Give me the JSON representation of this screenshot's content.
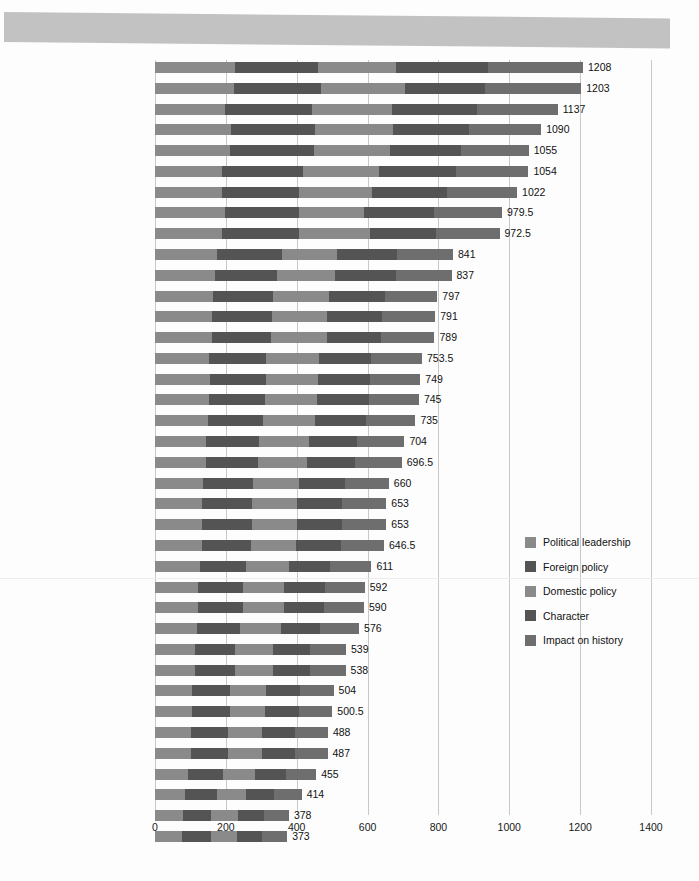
{
  "chart_data": {
    "type": "bar",
    "subtype": "stacked-horizontal",
    "title": "",
    "xlabel": "",
    "ylabel": "",
    "xlim": [
      0,
      1400
    ],
    "xticks": [
      0,
      200,
      400,
      600,
      800,
      1000,
      1200,
      1400
    ],
    "grid": true,
    "legend_position": "right",
    "series": [
      {
        "name": "Political leadership",
        "color": "#8a8a8a"
      },
      {
        "name": "Foreign policy",
        "color": "#545454"
      },
      {
        "name": "Domestic policy",
        "color": "#8a8a8a"
      },
      {
        "name": "Character",
        "color": "#545454"
      },
      {
        "name": "Impact on history",
        "color": "#6e6e6e"
      }
    ],
    "categories": [
      "Abraham Lincoln",
      "Franklin D. Roosevelt",
      "George Washington",
      "Theodore Roosevelt",
      "Thomas Jefferson",
      "Harry Truman",
      "Woodrow Wilson",
      "Andrew Jackson",
      "Dwight D. Eisenhower",
      "Ronald Reagan",
      "James K. Polk",
      "James Madison",
      "James Monroe",
      "William McKinley",
      "Lyndon B. Johnson",
      "John Adams",
      "Grover Cleveland",
      "John F. Kennedy",
      "Richard M. Nixon",
      "John Quincy Adams",
      "George Bush",
      "William Howard Taft",
      "Jimmy Carter",
      "Herbert C. Hoover",
      "Martin Van Buren",
      "Calvin Coolidge",
      "Rutherford B. Hayes",
      "Gerald R. Ford",
      "Ulysses S. Grant",
      "John Tyler",
      "Benjamin Harrison",
      "Zachary Taylor",
      "Millard Fillmore",
      "Chester A. Arthur",
      "Andrew Johnson",
      "Franklin Pierce",
      "James Buchanan",
      "Warren G. Harding"
    ],
    "values": [
      1208,
      1203,
      1137,
      1090,
      1055,
      1054,
      1022,
      979.5,
      972.5,
      841,
      837,
      797,
      791,
      789,
      753.5,
      749,
      745,
      735,
      704,
      696.5,
      660,
      653,
      653,
      646.5,
      611,
      592,
      590,
      576,
      539,
      538,
      504,
      500.5,
      488,
      487,
      455,
      414,
      378,
      373
    ],
    "value_labels": [
      "1208",
      "1203",
      "1137",
      "1090",
      "1055",
      "1054",
      "1022",
      "979.5",
      "972.5",
      "841",
      "837",
      "797",
      "791",
      "789",
      "753.5",
      "749",
      "745",
      "735",
      "704",
      "696.5",
      "660",
      "653",
      "653",
      "646.5",
      "611",
      "592",
      "590",
      "576",
      "539",
      "538",
      "504",
      "500.5",
      "488",
      "487",
      "455",
      "414",
      "378",
      "373"
    ],
    "stacks": [
      [
        227,
        232,
        222,
        258,
        269
      ],
      [
        222,
        247,
        238,
        224,
        272
      ],
      [
        198,
        246,
        224,
        240,
        229
      ],
      [
        215,
        238,
        220,
        213,
        204
      ],
      [
        213,
        237,
        213,
        201,
        191
      ],
      [
        189,
        228,
        214,
        218,
        205
      ],
      [
        189,
        217,
        206,
        212,
        198
      ],
      [
        198,
        209,
        183,
        198,
        191.5
      ],
      [
        189,
        217,
        200,
        188,
        178.5
      ],
      [
        176,
        182,
        156,
        170,
        157
      ],
      [
        168,
        177,
        162,
        172,
        158
      ],
      [
        164,
        168,
        158,
        158,
        149
      ],
      [
        162,
        167,
        157,
        156,
        149
      ],
      [
        160,
        167,
        158,
        154,
        150
      ],
      [
        152,
        160,
        152,
        145,
        144.5
      ],
      [
        154,
        158,
        148,
        147,
        142
      ],
      [
        152,
        158,
        147,
        147,
        141
      ],
      [
        150,
        156,
        145,
        145,
        139
      ],
      [
        144,
        150,
        140,
        136,
        134
      ],
      [
        143,
        148,
        138,
        135,
        132.5
      ],
      [
        136,
        141,
        130,
        128,
        125
      ],
      [
        134,
        139,
        129,
        127,
        124
      ],
      [
        134,
        139,
        129,
        127,
        124
      ],
      [
        133,
        138,
        128,
        125,
        122.5
      ],
      [
        126,
        130,
        121,
        118,
        116
      ],
      [
        122,
        126,
        117,
        115,
        112
      ],
      [
        122,
        125,
        117,
        114,
        112
      ],
      [
        119,
        122,
        114,
        112,
        109
      ],
      [
        112,
        115,
        107,
        104,
        101
      ],
      [
        112,
        114,
        107,
        104,
        101
      ],
      [
        104,
        108,
        100,
        97,
        95
      ],
      [
        104,
        107,
        99,
        96,
        94.5
      ],
      [
        101,
        104,
        97,
        94,
        92
      ],
      [
        101,
        104,
        97,
        94,
        91
      ],
      [
        94,
        97,
        90,
        88,
        86
      ],
      [
        86,
        88,
        82,
        80,
        78
      ],
      [
        78,
        81,
        75,
        73,
        71
      ],
      [
        77,
        80,
        74,
        72,
        70
      ]
    ]
  },
  "legend": {
    "items": [
      {
        "label": "Political leadership",
        "color": "#8a8a8a"
      },
      {
        "label": "Foreign policy",
        "color": "#545454"
      },
      {
        "label": "Domestic policy",
        "color": "#8a8a8a"
      },
      {
        "label": "Character",
        "color": "#545454"
      },
      {
        "label": "Impact on history",
        "color": "#6e6e6e"
      }
    ]
  },
  "header": {
    "band_color": "#c2c2c2"
  }
}
